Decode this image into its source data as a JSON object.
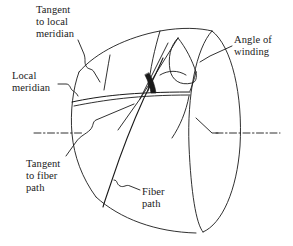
{
  "figure": {
    "type": "technical-line-diagram",
    "background_color": "#ffffff",
    "line_color": "#1a1a1a",
    "text_color": "#1a1a1a"
  },
  "labels": {
    "tangent_to_local_meridian": "Tangent\nto local\nmeridian",
    "local_meridian": "Local\nmeridian",
    "angle_of_winding": "Angle of\nwinding",
    "tangent_to_fiber_path": "Tangent\nto fiber\npath",
    "fiber_path": "Fiber\npath"
  },
  "geometry": {
    "vertex_point": "intersection of local meridian and fiber path",
    "angle_marker": "filled wedge between tangent to local meridian and tangent to fiber path",
    "centerline_style": "dash-dot",
    "dome_outline": "ogival dome with polar opening ellipse and cylindrical end ellipse"
  }
}
